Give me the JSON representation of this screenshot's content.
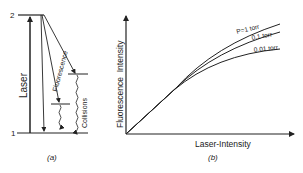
{
  "panel_a": {
    "caption": "(a)",
    "level_upper": "2",
    "level_lower": "1",
    "laser_label": "Laser",
    "fluorescence_label": "Fluorescence",
    "collisions_label": "Collisions"
  },
  "panel_b": {
    "caption": "(b)",
    "xlabel": "Laser-Intensity",
    "ylabel": "Fluorescence  Intensity",
    "curves": [
      {
        "label": "P=1 torr"
      },
      {
        "label": "0.1 torr"
      },
      {
        "label": "0.01 torr"
      }
    ]
  },
  "colors": {
    "ink": "#222222",
    "background": "#ffffff"
  }
}
